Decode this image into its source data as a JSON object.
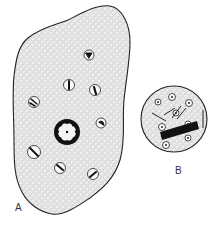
{
  "figure": {
    "panels": [
      {
        "label": "A",
        "description": "cell with many small nuclei and a large central nucleus"
      },
      {
        "label": "B",
        "description": "round cell with small nuclei and a dark rod"
      }
    ],
    "colors": {
      "ink": "#1a1a1a",
      "fill": "#ececec",
      "background": "#ffffff"
    }
  }
}
